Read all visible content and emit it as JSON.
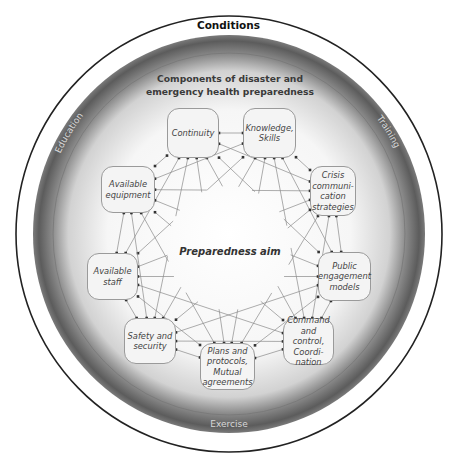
{
  "title": "Conditions",
  "subtitle_line1": "Components of disaster and",
  "subtitle_line2": "emergency health preparedness",
  "center_label": "Preparedness aim",
  "ring_labels": {
    "education": "Education",
    "training": "Training",
    "exercise": "Exercise"
  },
  "nodes": [
    {
      "id": "continuity",
      "lines": [
        "Continuity"
      ],
      "x": 167,
      "y": 108,
      "w": 52,
      "h": 50
    },
    {
      "id": "knowledge",
      "lines": [
        "Knowledge,",
        "Skills"
      ],
      "x": 243,
      "y": 108,
      "w": 53,
      "h": 50
    },
    {
      "id": "crisis",
      "lines": [
        "Crisis",
        "communi-",
        "cation",
        "strategies"
      ],
      "x": 310,
      "y": 166,
      "w": 46,
      "h": 50
    },
    {
      "id": "public",
      "lines": [
        "Public",
        "engagement",
        "models"
      ],
      "x": 318,
      "y": 252,
      "w": 53,
      "h": 49
    },
    {
      "id": "command",
      "lines": [
        "Command",
        "and control,",
        "Coordi-",
        "nation"
      ],
      "x": 283,
      "y": 318,
      "w": 51,
      "h": 47
    },
    {
      "id": "plans",
      "lines": [
        "Plans and",
        "protocols,",
        "Mutual",
        "agreements"
      ],
      "x": 200,
      "y": 343,
      "w": 55,
      "h": 47
    },
    {
      "id": "safety",
      "lines": [
        "Safety and",
        "security"
      ],
      "x": 124,
      "y": 318,
      "w": 52,
      "h": 46
    },
    {
      "id": "staff",
      "lines": [
        "Available",
        "staff"
      ],
      "x": 87,
      "y": 253,
      "w": 51,
      "h": 47
    },
    {
      "id": "equipment",
      "lines": [
        "Available",
        "equipment"
      ],
      "x": 101,
      "y": 166,
      "w": 54,
      "h": 47
    }
  ],
  "colors": {
    "outer_ring": "#222222",
    "disc_edge": "#5a5a5a",
    "disc_center": "#ffffff",
    "line": "#8a8a8a",
    "node_border": "#9a9a9a",
    "ring_text": "#d8d8d8"
  },
  "geometry": {
    "cx": 229,
    "cy": 234,
    "outer_rx": 213,
    "outer_ry": 218,
    "disc_rx": 196,
    "disc_ry": 199,
    "inner_rx": 176,
    "inner_ry": 181,
    "center_clear_r": 62
  }
}
